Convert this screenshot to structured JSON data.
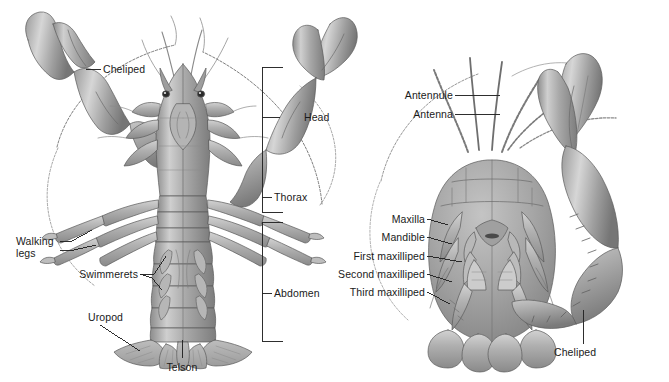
{
  "figure": {
    "background_color": "#ffffff",
    "label_color": "#1a1a1a",
    "leader_color": "#2b2b2b",
    "panels": [
      {
        "id": "dorsal",
        "name": "dorsal-view"
      },
      {
        "id": "ventral",
        "name": "ventral-view"
      }
    ]
  },
  "labels": {
    "cheliped_left": "Cheliped",
    "head": "Head",
    "thorax": "Thorax",
    "abdomen": "Abdomen",
    "walking_legs_line1": "Walking",
    "walking_legs_line2": "legs",
    "swimmerets": "Swimmerets",
    "uropod": "Uropod",
    "telson": "Telson",
    "antennule": "Antennule",
    "antenna": "Antenna",
    "maxilla": "Maxilla",
    "mandible": "Mandible",
    "first_maxilliped": "First maxilliped",
    "second_maxilliped": "Second maxilliped",
    "third_maxilliped": "Third maxilliped",
    "cheliped_right": "Cheliped"
  }
}
